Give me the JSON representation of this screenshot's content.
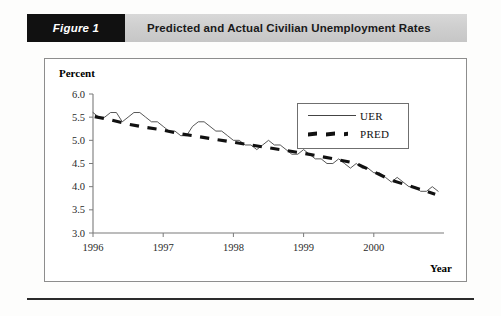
{
  "figure": {
    "tag_label": "Figure 1",
    "title": "Predicted and Actual Civilian Unemployment Rates"
  },
  "chart_data": {
    "type": "line",
    "title": "Predicted and Actual Civilian Unemployment Rates",
    "xlabel": "Year",
    "ylabel": "Percent",
    "ylim": [
      3.0,
      6.0
    ],
    "xlim": [
      1996.0,
      2001.0
    ],
    "yticks": [
      "3.0",
      "3.5",
      "4.0",
      "4.5",
      "5.0",
      "5.5",
      "6.0"
    ],
    "ytick_values": [
      3.0,
      3.5,
      4.0,
      4.5,
      5.0,
      5.5,
      6.0
    ],
    "xticks": [
      "1996",
      "1997",
      "1998",
      "1999",
      "2000"
    ],
    "xtick_values": [
      1996,
      1997,
      1998,
      1999,
      2000
    ],
    "grid": false,
    "legend_position": "upper right",
    "series": [
      {
        "name": "UER",
        "style": "solid",
        "color": "#444444",
        "x": [
          1996.0,
          1996.083,
          1996.167,
          1996.25,
          1996.333,
          1996.417,
          1996.5,
          1996.583,
          1996.667,
          1996.75,
          1996.833,
          1996.917,
          1997.0,
          1997.083,
          1997.167,
          1997.25,
          1997.333,
          1997.417,
          1997.5,
          1997.583,
          1997.667,
          1997.75,
          1997.833,
          1997.917,
          1998.0,
          1998.083,
          1998.167,
          1998.25,
          1998.333,
          1998.417,
          1998.5,
          1998.583,
          1998.667,
          1998.75,
          1998.833,
          1998.917,
          1999.0,
          1999.083,
          1999.167,
          1999.25,
          1999.333,
          1999.417,
          1999.5,
          1999.583,
          1999.667,
          1999.75,
          1999.833,
          1999.917,
          2000.0,
          2000.083,
          2000.167,
          2000.25,
          2000.333,
          2000.417,
          2000.5,
          2000.583,
          2000.667,
          2000.75,
          2000.833,
          2000.917
        ],
        "y": [
          5.6,
          5.5,
          5.5,
          5.6,
          5.6,
          5.4,
          5.5,
          5.6,
          5.6,
          5.5,
          5.4,
          5.4,
          5.3,
          5.2,
          5.2,
          5.1,
          5.1,
          5.3,
          5.4,
          5.4,
          5.3,
          5.2,
          5.2,
          5.1,
          5.0,
          5.0,
          4.9,
          4.9,
          4.8,
          4.9,
          5.0,
          4.9,
          4.9,
          4.8,
          4.7,
          4.7,
          4.8,
          4.7,
          4.6,
          4.6,
          4.5,
          4.5,
          4.6,
          4.5,
          4.4,
          4.5,
          4.4,
          4.4,
          4.3,
          4.3,
          4.2,
          4.1,
          4.2,
          4.1,
          4.0,
          4.0,
          3.9,
          3.9,
          4.0,
          3.9
        ],
        "start": 5.6,
        "end": 3.9
      },
      {
        "name": "PRED",
        "style": "dashed",
        "color": "#111111",
        "x": [
          1996.0,
          1996.25,
          1996.5,
          1996.75,
          1997.0,
          1997.25,
          1997.5,
          1997.75,
          1998.0,
          1998.25,
          1998.5,
          1998.75,
          1999.0,
          1999.25,
          1999.5,
          1999.75,
          2000.0,
          2000.25,
          2000.5,
          2000.75,
          2000.95
        ],
        "y": [
          5.52,
          5.44,
          5.35,
          5.28,
          5.22,
          5.14,
          5.08,
          5.02,
          4.96,
          4.9,
          4.84,
          4.78,
          4.72,
          4.65,
          4.58,
          4.5,
          4.32,
          4.14,
          4.02,
          3.9,
          3.8
        ],
        "start": 5.52,
        "end": 3.8
      }
    ],
    "legend": [
      "UER",
      "PRED"
    ]
  }
}
